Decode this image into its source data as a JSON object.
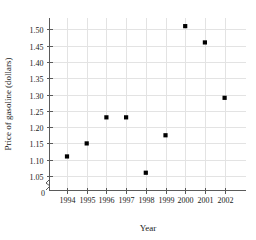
{
  "chart_data": {
    "type": "scatter",
    "title": "",
    "xlabel": "Year",
    "ylabel": "Price of gasoline (dollars)",
    "x": [
      1994,
      1995,
      1996,
      1997,
      1998,
      1999,
      2000,
      2001,
      2002
    ],
    "values": [
      1.11,
      1.15,
      1.23,
      1.23,
      1.06,
      1.175,
      1.51,
      1.46,
      1.29
    ],
    "points": [
      {
        "year": "1994",
        "price": 1.11
      },
      {
        "year": "1995",
        "price": 1.15
      },
      {
        "year": "1996",
        "price": 1.23
      },
      {
        "year": "1997",
        "price": 1.23
      },
      {
        "year": "1998",
        "price": 1.06
      },
      {
        "year": "1999",
        "price": 1.175
      },
      {
        "year": "2000",
        "price": 1.51
      },
      {
        "year": "2001",
        "price": 1.46
      },
      {
        "year": "2002",
        "price": 1.29
      }
    ],
    "xtick_labels": [
      "1994",
      "1995",
      "1996",
      "1997",
      "1998",
      "1999",
      "2000",
      "2001",
      "2002"
    ],
    "ytick_labels": [
      "1.50",
      "1.45",
      "1.40",
      "1.35",
      "1.30",
      "1.25",
      "1.20",
      "1.15",
      "1.10",
      "1.05"
    ],
    "ytick_values": [
      1.5,
      1.45,
      1.4,
      1.35,
      1.3,
      1.25,
      1.2,
      1.15,
      1.1,
      1.05
    ],
    "yzero_label": "0",
    "ylim": [
      1.03,
      1.535
    ],
    "xlim": [
      1993.4,
      2002.6
    ],
    "axis_break": true,
    "grid": true,
    "legend": null,
    "marker": "square",
    "marker_color": "#000000",
    "grid_color": "#e3e3e3",
    "axis_color": "#5a5a5a"
  }
}
